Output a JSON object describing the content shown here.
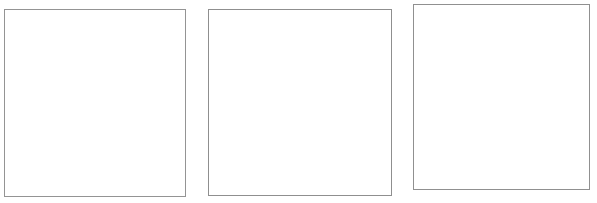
{
  "page": {
    "background_color": "#ffffff",
    "width": 597,
    "height": 203
  },
  "frames": [
    {
      "id": "frame-1",
      "label": "",
      "x": 4,
      "y": 9,
      "width": 182,
      "height": 188,
      "border_color": "#949494",
      "border_width": 1,
      "fill_color": "#ffffff",
      "content": ""
    },
    {
      "id": "frame-2",
      "label": "",
      "x": 208,
      "y": 9,
      "width": 184,
      "height": 187,
      "border_color": "#8f8f8f",
      "border_width": 1,
      "fill_color": "#ffffff",
      "content": ""
    },
    {
      "id": "frame-3",
      "label": "",
      "x": 413,
      "y": 4,
      "width": 177,
      "height": 186,
      "border_color": "#909090",
      "border_width": 1,
      "fill_color": "#ffffff",
      "content": ""
    }
  ]
}
